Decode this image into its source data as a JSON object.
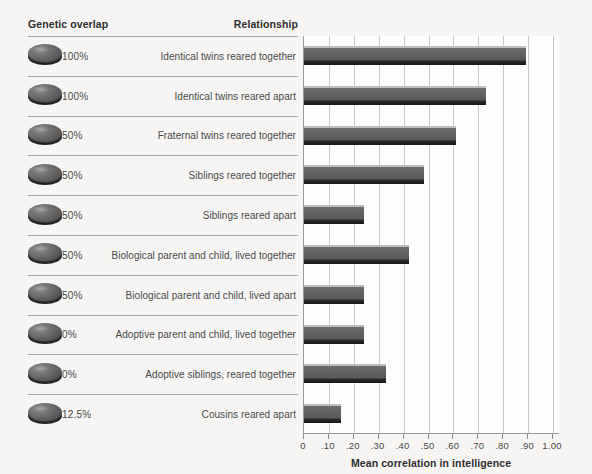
{
  "headers": {
    "genetic_overlap": "Genetic overlap",
    "relationship": "Relationship"
  },
  "chart_data": {
    "type": "bar",
    "orientation": "horizontal",
    "title": "",
    "xlabel": "Mean correlation in intelligence",
    "ylabel": "",
    "xlim": [
      0,
      1.0
    ],
    "xticks": [
      "0",
      ".10",
      ".20",
      ".30",
      ".40",
      ".50",
      ".60",
      ".70",
      ".80",
      ".90",
      "1.00"
    ],
    "xtick_values": [
      0,
      0.1,
      0.2,
      0.3,
      0.4,
      0.5,
      0.6,
      0.7,
      0.8,
      0.9,
      1.0
    ],
    "grid": true,
    "legend": "none",
    "bar_color": "#5a5a5a",
    "categories": [
      "Identical twins reared together",
      "Identical twins reared apart",
      "Fraternal twins reared together",
      "Siblings reared together",
      "Siblings reared apart",
      "Biological parent and child, lived together",
      "Biological parent and child, lived apart",
      "Adoptive parent and child, lived together",
      "Adoptive siblings, reared together",
      "Cousins reared apart"
    ],
    "values": [
      0.89,
      0.73,
      0.61,
      0.48,
      0.24,
      0.42,
      0.24,
      0.24,
      0.33,
      0.15
    ],
    "genetic_overlap": [
      "100%",
      "100%",
      "50%",
      "50%",
      "50%",
      "50%",
      "50%",
      "0%",
      "0%",
      "12.5%"
    ]
  },
  "rows": [
    {
      "overlap": "100%",
      "relationship": "Identical twins reared together",
      "value": 0.89,
      "icon": "genetic-disc-icon"
    },
    {
      "overlap": "100%",
      "relationship": "Identical twins reared apart",
      "value": 0.73,
      "icon": "genetic-disc-icon"
    },
    {
      "overlap": "50%",
      "relationship": "Fraternal twins reared together",
      "value": 0.61,
      "icon": "genetic-disc-icon"
    },
    {
      "overlap": "50%",
      "relationship": "Siblings reared together",
      "value": 0.48,
      "icon": "genetic-disc-icon"
    },
    {
      "overlap": "50%",
      "relationship": "Siblings reared apart",
      "value": 0.24,
      "icon": "genetic-disc-icon"
    },
    {
      "overlap": "50%",
      "relationship": "Biological parent and child, lived together",
      "value": 0.42,
      "icon": "genetic-disc-icon"
    },
    {
      "overlap": "50%",
      "relationship": "Biological parent and child, lived apart",
      "value": 0.24,
      "icon": "genetic-disc-icon"
    },
    {
      "overlap": "0%",
      "relationship": "Adoptive parent and child, lived together",
      "value": 0.24,
      "icon": "genetic-disc-icon"
    },
    {
      "overlap": "0%",
      "relationship": "Adoptive siblings, reared together",
      "value": 0.33,
      "icon": "genetic-disc-icon"
    },
    {
      "overlap": "12.5%",
      "relationship": "Cousins reared apart",
      "value": 0.15,
      "icon": "genetic-disc-icon"
    }
  ]
}
